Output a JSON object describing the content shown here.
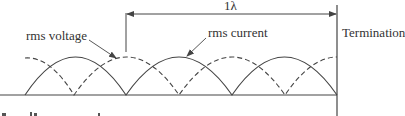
{
  "diagram": {
    "labels": {
      "wavelength": "1λ",
      "voltage": "rms voltage",
      "current": "rms current",
      "termination": "Termination"
    },
    "colors": {
      "line": "#444444",
      "text": "#333333",
      "background": "#ffffff"
    },
    "curves": {
      "current": {
        "style": "solid",
        "zeros_x": [
          25,
          126,
          232,
          337
        ]
      },
      "voltage": {
        "style": "dashed",
        "zeros_x": [
          74,
          179,
          285
        ]
      }
    }
  }
}
